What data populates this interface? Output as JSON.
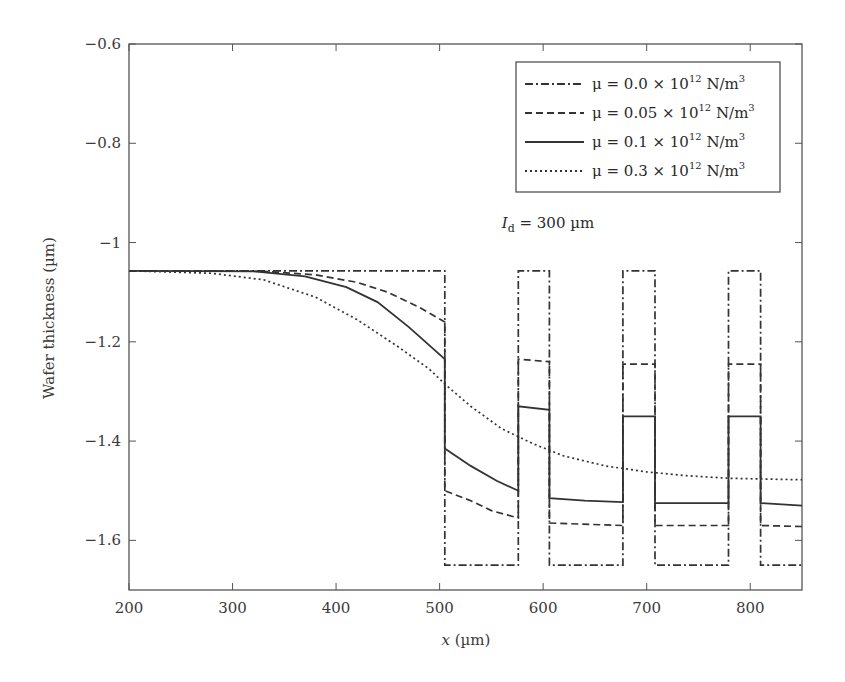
{
  "chart_data": {
    "type": "line",
    "title": "",
    "xlabel": "x (µm)",
    "ylabel": "Wafer thickness (µm)",
    "xlim": [
      200,
      850
    ],
    "ylim": [
      -1.7,
      -0.6
    ],
    "xticks": [
      200,
      300,
      400,
      500,
      600,
      700,
      800
    ],
    "yticks": [
      -0.6,
      -0.8,
      -1,
      -1.2,
      -1.4,
      -1.6
    ],
    "xtick_labels": [
      "200",
      "300",
      "400",
      "500",
      "600",
      "700",
      "800"
    ],
    "ytick_labels": [
      "−0.6",
      "−0.8",
      "−1",
      "−1.2",
      "−1.4",
      "−1.6"
    ],
    "grid": false,
    "legend_position": "upper right",
    "annotation": {
      "text_main": "I",
      "text_sub": "d",
      "text_rest": " = 300 µm",
      "x": 560,
      "y": -0.97
    },
    "series": [
      {
        "name": "μ = 0.0 × 10^12 N/m^3",
        "legend_label": "μ = 0.0 × 10",
        "legend_exp": "12",
        "legend_unit": " N/m",
        "legend_unit_exp": "3",
        "style": "dashdot",
        "points": [
          [
            200,
            -1.057
          ],
          [
            505,
            -1.057
          ],
          [
            505,
            -1.65
          ],
          [
            576,
            -1.65
          ],
          [
            576,
            -1.057
          ],
          [
            606,
            -1.057
          ],
          [
            606,
            -1.65
          ],
          [
            677,
            -1.65
          ],
          [
            677,
            -1.057
          ],
          [
            708,
            -1.057
          ],
          [
            708,
            -1.65
          ],
          [
            779,
            -1.65
          ],
          [
            779,
            -1.057
          ],
          [
            810,
            -1.057
          ],
          [
            810,
            -1.65
          ],
          [
            850,
            -1.65
          ]
        ]
      },
      {
        "name": "μ = 0.05 × 10^12 N/m^3",
        "legend_label": "μ = 0.05 × 10",
        "legend_exp": "12",
        "legend_unit": " N/m",
        "legend_unit_exp": "3",
        "style": "dashed",
        "points": [
          [
            200,
            -1.057
          ],
          [
            330,
            -1.058
          ],
          [
            380,
            -1.065
          ],
          [
            420,
            -1.08
          ],
          [
            450,
            -1.1
          ],
          [
            480,
            -1.13
          ],
          [
            505,
            -1.16
          ],
          [
            505,
            -1.5
          ],
          [
            530,
            -1.52
          ],
          [
            550,
            -1.54
          ],
          [
            576,
            -1.555
          ],
          [
            576,
            -1.235
          ],
          [
            606,
            -1.24
          ],
          [
            606,
            -1.565
          ],
          [
            677,
            -1.57
          ],
          [
            677,
            -1.245
          ],
          [
            708,
            -1.245
          ],
          [
            708,
            -1.57
          ],
          [
            779,
            -1.57
          ],
          [
            779,
            -1.245
          ],
          [
            810,
            -1.245
          ],
          [
            810,
            -1.57
          ],
          [
            850,
            -1.572
          ]
        ]
      },
      {
        "name": "μ = 0.1 × 10^12 N/m^3",
        "legend_label": "μ = 0.1 × 10",
        "legend_exp": "12",
        "legend_unit": " N/m",
        "legend_unit_exp": "3",
        "style": "solid",
        "points": [
          [
            200,
            -1.057
          ],
          [
            320,
            -1.058
          ],
          [
            370,
            -1.068
          ],
          [
            410,
            -1.09
          ],
          [
            440,
            -1.12
          ],
          [
            470,
            -1.17
          ],
          [
            505,
            -1.235
          ],
          [
            505,
            -1.415
          ],
          [
            530,
            -1.45
          ],
          [
            555,
            -1.48
          ],
          [
            576,
            -1.5
          ],
          [
            576,
            -1.33
          ],
          [
            606,
            -1.337
          ],
          [
            606,
            -1.515
          ],
          [
            640,
            -1.52
          ],
          [
            677,
            -1.523
          ],
          [
            677,
            -1.35
          ],
          [
            708,
            -1.35
          ],
          [
            708,
            -1.525
          ],
          [
            779,
            -1.525
          ],
          [
            779,
            -1.35
          ],
          [
            810,
            -1.35
          ],
          [
            810,
            -1.525
          ],
          [
            850,
            -1.53
          ]
        ]
      },
      {
        "name": "μ = 0.3 × 10^12 N/m^3",
        "legend_label": "μ = 0.3 × 10",
        "legend_exp": "12",
        "legend_unit": " N/m",
        "legend_unit_exp": "3",
        "style": "dotted",
        "points": [
          [
            200,
            -1.057
          ],
          [
            280,
            -1.062
          ],
          [
            330,
            -1.075
          ],
          [
            380,
            -1.11
          ],
          [
            420,
            -1.155
          ],
          [
            460,
            -1.21
          ],
          [
            490,
            -1.255
          ],
          [
            505,
            -1.285
          ],
          [
            530,
            -1.33
          ],
          [
            560,
            -1.375
          ],
          [
            590,
            -1.405
          ],
          [
            620,
            -1.43
          ],
          [
            660,
            -1.45
          ],
          [
            700,
            -1.462
          ],
          [
            740,
            -1.47
          ],
          [
            780,
            -1.475
          ],
          [
            850,
            -1.478
          ]
        ]
      }
    ]
  }
}
